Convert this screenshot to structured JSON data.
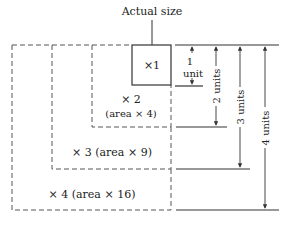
{
  "diagram": {
    "callout_label": "Actual size",
    "boxes": [
      {
        "label": "×1",
        "style": "solid"
      },
      {
        "label_line1": "× 2",
        "label_line2": "(area × 4)",
        "style": "dashed"
      },
      {
        "label": "× 3 (area × 9)",
        "style": "dashed"
      },
      {
        "label": "× 4 (area × 16)",
        "style": "dashed"
      }
    ],
    "dimensions": [
      {
        "label_line1": "1",
        "label_line2": "unit"
      },
      {
        "label": "2 units"
      },
      {
        "label": "3 units"
      },
      {
        "label": "4 units"
      }
    ],
    "colors": {
      "line": "#333333",
      "text": "#222222",
      "background": "#ffffff"
    }
  }
}
